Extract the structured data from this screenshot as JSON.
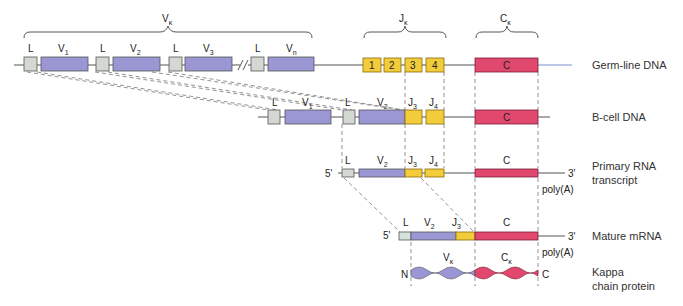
{
  "colors": {
    "v_segment": "#9b96d4",
    "l_segment": "#d4d8d2",
    "j_segment": "#f2cc3a",
    "c_segment": "#e0486e",
    "line": "#555555",
    "tail_line": "#7c8fd0"
  },
  "top_braces": {
    "v": {
      "label": "V",
      "sub": "κ"
    },
    "j": {
      "label": "J",
      "sub": "κ"
    },
    "c": {
      "label": "C",
      "sub": "κ"
    }
  },
  "germline": {
    "row_label": "Germ-line DNA",
    "segments": [
      {
        "type": "L",
        "label": "L"
      },
      {
        "type": "V",
        "label": "V",
        "sub": "1"
      },
      {
        "type": "L",
        "label": "L"
      },
      {
        "type": "V",
        "label": "V",
        "sub": "2"
      },
      {
        "type": "L",
        "label": "L"
      },
      {
        "type": "V",
        "label": "V",
        "sub": "3"
      },
      {
        "type": "L",
        "label": "L"
      },
      {
        "type": "V",
        "label": "V",
        "sub": "n"
      }
    ],
    "j_numbers": [
      "1",
      "2",
      "3",
      "4"
    ],
    "c_label": "C"
  },
  "bcell": {
    "row_label": "B-cell DNA",
    "labels": {
      "l1": "L",
      "v1": "V",
      "v1_sub": "1",
      "l2": "L",
      "v2": "V",
      "v2_sub": "2",
      "j3": "J",
      "j3_sub": "3",
      "j4": "J",
      "j4_sub": "4",
      "c": "C"
    }
  },
  "primary_rna": {
    "row_label_1": "Primary RNA",
    "row_label_2": "transcript",
    "five_prime": "5'",
    "three_prime": "3'",
    "poly_a": "poly(A)",
    "labels": {
      "l": "L",
      "v2": "V",
      "v2_sub": "2",
      "j3": "J",
      "j3_sub": "3",
      "j4": "J",
      "j4_sub": "4",
      "c": "C"
    }
  },
  "mature_mrna": {
    "row_label": "Mature mRNA",
    "five_prime": "5'",
    "three_prime": "3'",
    "poly_a": "poly(A)",
    "labels": {
      "l": "L",
      "v2": "V",
      "v2_sub": "2",
      "j3": "J",
      "j3_sub": "3",
      "c": "C"
    }
  },
  "protein": {
    "row_label_1": "Kappa",
    "row_label_2": "chain protein",
    "n_term": "N",
    "c_term": "C",
    "v_label": "V",
    "v_sub": "κ",
    "c_label": "C",
    "c_sub": "κ"
  }
}
